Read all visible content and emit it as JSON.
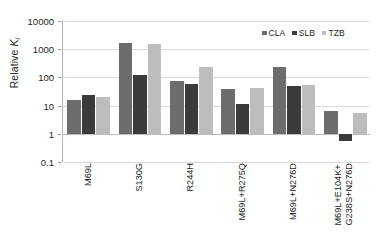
{
  "chart_data": {
    "type": "bar",
    "title": "",
    "xlabel": "",
    "ylabel": "Relative Ki",
    "ylabel_parts": {
      "prefix": "Relative ",
      "symbol": "K",
      "subscript": "i"
    },
    "yscale": "log",
    "ylim": [
      0.1,
      10000
    ],
    "ytick_labels": [
      "10000",
      "1000",
      "100",
      "10",
      "1",
      "0.1"
    ],
    "ytick_values": [
      10000,
      1000,
      100,
      10,
      1,
      0.1
    ],
    "grid": true,
    "baseline": 1,
    "legend_position": "top-right",
    "categories": [
      "M69L",
      "S130G",
      "R244H",
      "M69L+R275Q",
      "M69L+N276D",
      "M69L+E104K+ G238S+N276D"
    ],
    "category_lines": [
      [
        "M69L"
      ],
      [
        "S130G"
      ],
      [
        "R244H"
      ],
      [
        "M69L+R275Q"
      ],
      [
        "M69L+N276D"
      ],
      [
        "M69L+E104K+",
        "G238S+N276D"
      ]
    ],
    "series": [
      {
        "name": "CLA",
        "color": "#6d6d6d",
        "values": [
          16,
          1700,
          74,
          39,
          240,
          6.7
        ]
      },
      {
        "name": "SLB",
        "color": "#3b3b3b",
        "values": [
          24,
          125,
          57,
          11,
          50,
          0.55
        ]
      },
      {
        "name": "TZB",
        "color": "#bdbdbd",
        "values": [
          21,
          1500,
          225,
          43,
          55,
          5.6
        ]
      }
    ]
  },
  "legend": {
    "items": [
      {
        "label": "CLA",
        "color": "#6d6d6d"
      },
      {
        "label": "SLB",
        "color": "#3b3b3b"
      },
      {
        "label": "TZB",
        "color": "#bdbdbd"
      }
    ]
  }
}
